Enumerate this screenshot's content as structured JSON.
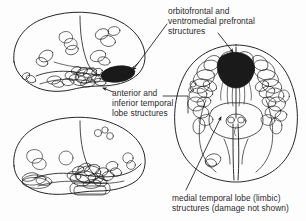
{
  "figure": {
    "name": "brain-lesion-overlap-diagram",
    "background_color": "#fdfdfd",
    "ink_color": "#1a1a1a",
    "text_color": "#2b2b2b"
  },
  "labels": {
    "orbitofrontal": {
      "line1": "orbitofrontal and",
      "line2": "ventromedial prefrontal",
      "line3": "structures"
    },
    "anterior_inferior_temporal": {
      "line1": "anterior and",
      "line2": "inferior temporal",
      "line3": "lobe structures"
    },
    "medial_temporal": {
      "line1": "medial temporal lobe (limbic)",
      "line2": "structures (damage not shown)"
    }
  },
  "views": {
    "lateral_upper": {
      "name": "lateral-brain-view-upper"
    },
    "lateral_lower": {
      "name": "lateral-brain-view-lower"
    },
    "ventral": {
      "name": "ventral-brain-view"
    }
  },
  "annotations": {
    "arrow_to_lateral_temporal_pole": "arrow-orbitofrontal-to-lateral",
    "arrow_to_ventral_frontal": "arrow-orbitofrontal-to-ventral",
    "arrow_to_anterior_temporal": "arrow-anterior-temporal",
    "leader_anterior_temporal_right": "leader-anterior-temporal-right",
    "arrow_to_medial_temporal": "arrow-medial-temporal"
  }
}
